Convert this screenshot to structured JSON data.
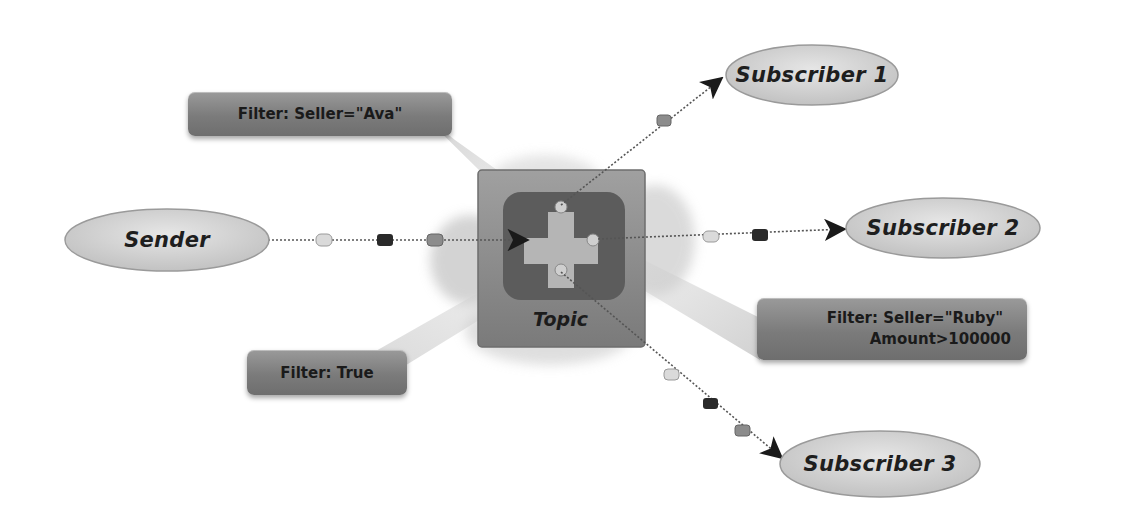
{
  "diagram": {
    "title": "",
    "nodes": {
      "sender": {
        "label": "Sender"
      },
      "topic": {
        "label": "Topic"
      },
      "subscriber1": {
        "label": "Subscriber 1"
      },
      "subscriber2": {
        "label": "Subscriber 2"
      },
      "subscriber3": {
        "label": "Subscriber 3"
      }
    },
    "filters": {
      "ava": {
        "label": "Filter: Seller=\"Ava\""
      },
      "ruby": {
        "line1": "Filter: Seller=\"Ruby\"",
        "line2": "Amount>100000"
      },
      "true": {
        "label": "Filter: True"
      }
    },
    "edges": [
      {
        "from": "Sender",
        "to": "Topic",
        "messages": [
          "light",
          "dark",
          "medium"
        ]
      },
      {
        "from": "Topic",
        "to": "Subscriber 1",
        "messages": [
          "medium"
        ],
        "filter": "Filter: Seller=\"Ava\""
      },
      {
        "from": "Topic",
        "to": "Subscriber 2",
        "messages": [
          "light",
          "dark"
        ],
        "filter": "Filter: Seller=\"Ruby\" Amount>100000"
      },
      {
        "from": "Topic",
        "to": "Subscriber 3",
        "messages": [
          "light",
          "dark",
          "medium"
        ],
        "filter": "Filter: True"
      }
    ],
    "colors": {
      "background": "#ffffff",
      "ellipse_fill": "#d8d8d8",
      "filter_fill": "#808080",
      "topic_fill": "#8a8a8a",
      "topic_inner": "#5a5a5a",
      "line": "#555555",
      "msg_light": "#d4d4d4",
      "msg_dark": "#2a2a2a",
      "msg_medium": "#8c8c8c"
    }
  }
}
